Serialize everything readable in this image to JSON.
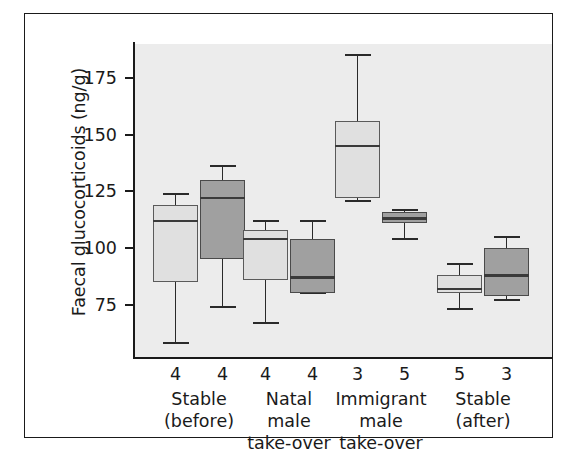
{
  "chart_data": {
    "type": "box",
    "title": "",
    "xlabel": "",
    "ylabel": "Faecal glucocorticoids (ng/g)",
    "ylim": [
      52,
      190
    ],
    "yticks": [
      75,
      100,
      125,
      150,
      175
    ],
    "ytick_labels": [
      "75",
      "100",
      "125",
      "150",
      "175"
    ],
    "grid": false,
    "legend": null,
    "panel_background": "#ececec",
    "series_colors": {
      "light": "#e0e0e0",
      "dark": "#a0a0a0"
    },
    "groups": [
      {
        "label_line1": "Stable",
        "label_line2": "(before)",
        "label_line3": "",
        "boxes": [
          {
            "shade": "light",
            "n": "4",
            "whisker_low": 58,
            "q1": 85,
            "median": 112,
            "q3": 119,
            "whisker_high": 124
          },
          {
            "shade": "dark",
            "n": "4",
            "whisker_low": 74,
            "q1": 95,
            "median": 122,
            "q3": 130,
            "whisker_high": 136
          }
        ]
      },
      {
        "label_line1": "Natal",
        "label_line2": "male",
        "label_line3": "take-over",
        "boxes": [
          {
            "shade": "light",
            "n": "4",
            "whisker_low": 67,
            "q1": 86,
            "median": 104,
            "q3": 108,
            "whisker_high": 112
          },
          {
            "shade": "dark",
            "n": "4",
            "whisker_low": 80,
            "q1": 80,
            "median": 87,
            "q3": 104,
            "whisker_high": 112
          }
        ]
      },
      {
        "label_line1": "Immigrant",
        "label_line2": "male",
        "label_line3": "take-over",
        "boxes": [
          {
            "shade": "light",
            "n": "3",
            "whisker_low": 121,
            "q1": 122,
            "median": 145,
            "q3": 156,
            "whisker_high": 185
          },
          {
            "shade": "dark",
            "n": "5",
            "whisker_low": 104,
            "q1": 111,
            "median": 113,
            "q3": 116,
            "whisker_high": 117
          }
        ]
      },
      {
        "label_line1": "Stable",
        "label_line2": "(after)",
        "label_line3": "",
        "boxes": [
          {
            "shade": "light",
            "n": "5",
            "whisker_low": 73,
            "q1": 80,
            "median": 82,
            "q3": 88,
            "whisker_high": 93
          },
          {
            "shade": "dark",
            "n": "3",
            "whisker_low": 77,
            "q1": 79,
            "median": 88,
            "q3": 100,
            "whisker_high": 105
          }
        ]
      }
    ]
  }
}
